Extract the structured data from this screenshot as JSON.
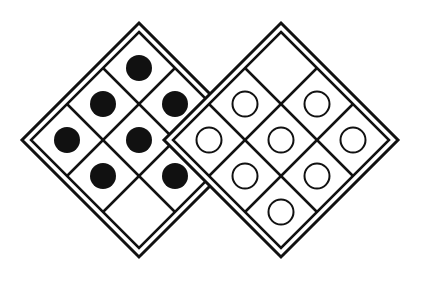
{
  "diagram": {
    "title": "",
    "background": "#ffffff",
    "stroke_color": "#111111",
    "boards": [
      {
        "name": "left-board",
        "center": [
          139,
          140
        ],
        "outer_half_diagonal": 117,
        "inner_half_diagonal": 108,
        "grid": 3,
        "piece": "black-dot",
        "pieces": [
          [
            0,
            0
          ],
          [
            0,
            1
          ],
          [
            0,
            2
          ],
          [
            1,
            0
          ],
          [
            1,
            1
          ],
          [
            1,
            2
          ],
          [
            2,
            0
          ],
          [
            2,
            1
          ]
        ]
      },
      {
        "name": "right-board",
        "center": [
          281,
          140
        ],
        "outer_half_diagonal": 117,
        "inner_half_diagonal": 108,
        "grid": 3,
        "piece": "white-circle",
        "pieces": [
          [
            0,
            1
          ],
          [
            0,
            2
          ],
          [
            1,
            0
          ],
          [
            1,
            1
          ],
          [
            1,
            2
          ],
          [
            2,
            0
          ],
          [
            2,
            1
          ],
          [
            2,
            2
          ]
        ]
      }
    ],
    "shared_cell": "empty",
    "counts": {
      "black_dots": 8,
      "white_circles": 8,
      "empty_cells": 1
    }
  }
}
